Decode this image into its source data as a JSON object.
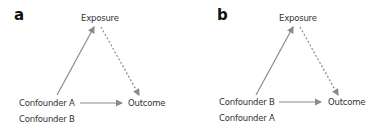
{
  "panels": [
    {
      "label": "a",
      "nodes": {
        "exposure": "Exposure",
        "outcome": "Outcome",
        "confounder_primary": "Confounder A",
        "confounder_secondary": "Confounder B"
      }
    },
    {
      "label": "b",
      "nodes": {
        "exposure": "Exposure",
        "outcome": "Outcome",
        "confounder_primary": "Confounder B",
        "confounder_secondary": "Confounder A"
      }
    }
  ],
  "colors": {
    "arrow": "#8a8a8a",
    "text": "#333333"
  }
}
